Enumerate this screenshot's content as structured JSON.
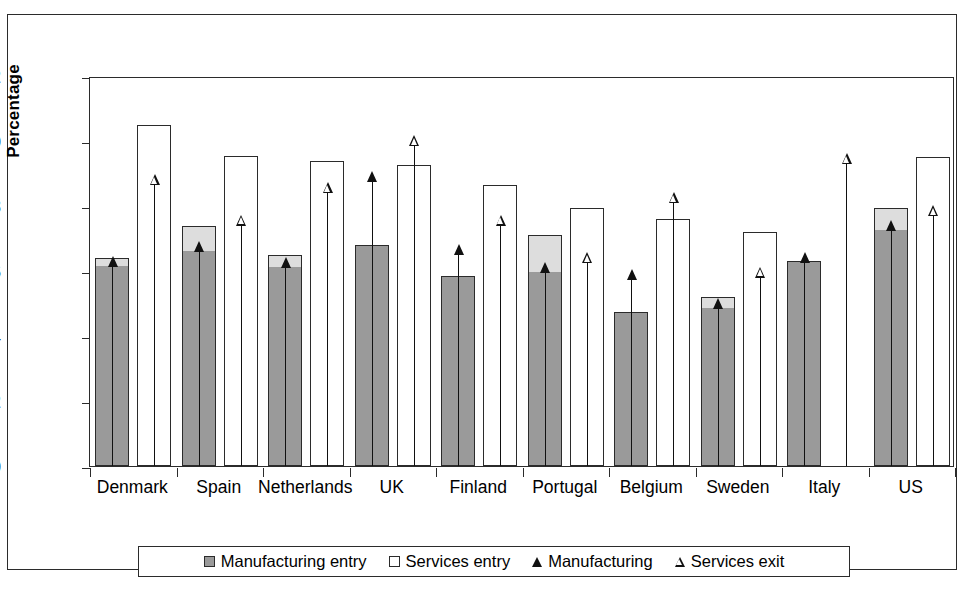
{
  "chart_data": {
    "type": "bar",
    "title": "",
    "xlabel": "Country",
    "ylabel": "Percentage",
    "ylim": [
      0,
      12
    ],
    "yticks": [
      0,
      2,
      4,
      6,
      8,
      10,
      12
    ],
    "grid": false,
    "legend_position": "bottom",
    "categories": [
      "Denmark",
      "Spain",
      "Netherlands",
      "UK",
      "Finland",
      "Portugal",
      "Belgium",
      "Sweden",
      "Italy",
      "US"
    ],
    "series": [
      {
        "name": "Manufacturing entry",
        "marker": "filled-square",
        "color": "#9a9a9a",
        "values": [
          6.4,
          7.4,
          6.5,
          6.8,
          5.85,
          7.1,
          4.75,
          5.2,
          6.3,
          7.95
        ]
      },
      {
        "name": "Services entry",
        "marker": "hollow-square",
        "color": "#ffffff",
        "values": [
          10.5,
          9.55,
          9.4,
          9.25,
          8.65,
          7.95,
          7.6,
          7.2,
          null,
          9.5
        ]
      },
      {
        "name": "Manufacturing",
        "marker": "solid-triangle",
        "color": "#111111",
        "values": [
          6.2,
          6.65,
          6.15,
          8.8,
          6.55,
          6.0,
          5.8,
          4.9,
          6.3,
          7.3
        ]
      },
      {
        "name": "Services exit",
        "marker": "open-triangle",
        "color": "#111111",
        "values": [
          8.7,
          7.45,
          8.45,
          9.9,
          7.45,
          6.3,
          8.15,
          5.85,
          9.35,
          7.75
        ]
      }
    ]
  },
  "legend": {
    "items": [
      {
        "label": "Manufacturing entry",
        "marker": "filled-square"
      },
      {
        "label": "Services entry",
        "marker": "hollow-square"
      },
      {
        "label": "Manufacturing",
        "marker": "solid-triangle"
      },
      {
        "label": "Services exit",
        "marker": "open-triangle"
      }
    ]
  },
  "colors": {
    "manufacturing_entry_fill": "#9a9a9a",
    "manufacturing_entry_cap": "#dddddd",
    "services_entry_fill": "#ffffff",
    "axis": "#2b2b2b",
    "arrow": "#111111"
  }
}
